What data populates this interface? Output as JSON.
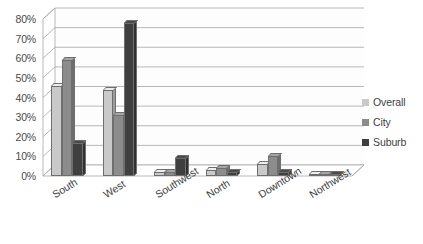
{
  "chart_data": {
    "type": "bar",
    "title": "",
    "xlabel": "",
    "ylabel": "",
    "ylim": [
      0,
      80
    ],
    "grid": true,
    "legend_position": "right",
    "style": "3d-clustered-column",
    "categories": [
      "South",
      "West",
      "Southwest",
      "North",
      "Downtown",
      "Northwest"
    ],
    "y_ticks": [
      "0%",
      "10%",
      "20%",
      "30%",
      "40%",
      "50%",
      "60%",
      "70%",
      "80%"
    ],
    "y_tick_values": [
      0,
      10,
      20,
      30,
      40,
      50,
      60,
      70,
      80
    ],
    "series": [
      {
        "name": "Overall",
        "color": "#c9c9c9",
        "values": [
          46,
          44,
          2,
          3,
          6,
          1
        ]
      },
      {
        "name": "City",
        "color": "#8c8c8c",
        "values": [
          59,
          31,
          2,
          4,
          10,
          1
        ]
      },
      {
        "name": "Suburb",
        "color": "#3f3f3f",
        "values": [
          17,
          78,
          9,
          2,
          2,
          1
        ]
      }
    ]
  },
  "legend": {
    "items": [
      {
        "label": "Overall",
        "color": "#c9c9c9"
      },
      {
        "label": "City",
        "color": "#8c8c8c"
      },
      {
        "label": "Suburb",
        "color": "#3f3f3f"
      }
    ]
  },
  "colors": {
    "overall": "#c9c9c9",
    "city": "#8c8c8c",
    "suburb": "#3f3f3f",
    "gridline": "#a6a6a6",
    "background": "#ffffff",
    "text": "#3d3d3d"
  }
}
